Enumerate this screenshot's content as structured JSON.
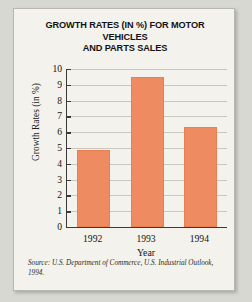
{
  "figure": {
    "title_line1": "GROWTH RATES (IN %) FOR MOTOR VEHICLES",
    "title_line2": "AND PARTS SALES",
    "source_label": "Source:",
    "source_text": " U.S. Department of Commerce, U.S. Industrial Outlook, 1994."
  },
  "colors": {
    "bar": "#ef8b60",
    "axis": "#3a3a38",
    "grid": "#c9c8c0",
    "card": "#f3f2ec",
    "page": "#d8d8d3"
  },
  "chart_data": {
    "type": "bar",
    "title": "GROWTH RATES (IN %) FOR MOTOR VEHICLES AND PARTS SALES",
    "xlabel": "Year",
    "ylabel": "Growth Rates (in %)",
    "categories": [
      "1992",
      "1993",
      "1994"
    ],
    "values": [
      4.9,
      9.5,
      6.3
    ],
    "ylim": [
      0,
      10
    ],
    "yticks": [
      0,
      1,
      2,
      3,
      4,
      5,
      6,
      7,
      8,
      9,
      10
    ],
    "ytick_labels": [
      "0",
      "1",
      "2",
      "3",
      "4",
      "5",
      "6",
      "7",
      "8",
      "9",
      "10"
    ],
    "grid": true,
    "legend": null,
    "series": [
      {
        "name": "Growth Rates (in %)",
        "values": [
          4.9,
          9.5,
          6.3
        ]
      }
    ],
    "annotations": [
      "Source: U.S. Department of Commerce, U.S. Industrial Outlook, 1994."
    ]
  }
}
